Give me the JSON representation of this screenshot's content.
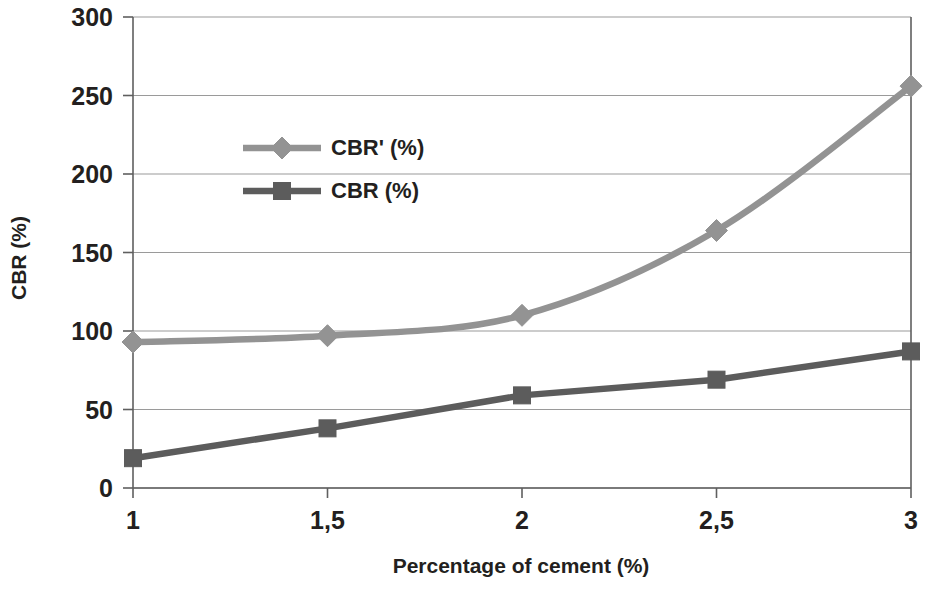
{
  "chart_data": {
    "type": "line",
    "title": "",
    "subtitle": "",
    "xlabel": "Percentage of cement (%)",
    "ylabel": "CBR (%)",
    "x": [
      1,
      1.5,
      2,
      2.5,
      3
    ],
    "xtick_labels": [
      "1",
      "1,5",
      "2",
      "2,5",
      "3"
    ],
    "ytick_labels": [
      "0",
      "50",
      "100",
      "150",
      "200",
      "250",
      "300"
    ],
    "yticks": [
      0,
      50,
      100,
      150,
      200,
      250,
      300
    ],
    "xlim": [
      1,
      3
    ],
    "ylim": [
      0,
      300
    ],
    "grid": "horizontal",
    "legend_position": "inside-upper-left",
    "series": [
      {
        "name": "CBR' (%)",
        "marker": "diamond",
        "color": "#939393",
        "smooth": true,
        "values": [
          93,
          97,
          110,
          164,
          256
        ]
      },
      {
        "name": "CBR (%)",
        "marker": "square",
        "color": "#5c5c5c",
        "smooth": false,
        "values": [
          19,
          38,
          59,
          69,
          87
        ]
      }
    ]
  },
  "legend": {
    "entries": [
      {
        "label": "CBR' (%)",
        "marker": "diamond-marker-icon",
        "color": "#939393"
      },
      {
        "label": "CBR (%)",
        "marker": "square-marker-icon",
        "color": "#5c5c5c"
      }
    ]
  },
  "axes": {
    "x_title": "Percentage of cement (%)",
    "y_title": "CBR (%)"
  }
}
